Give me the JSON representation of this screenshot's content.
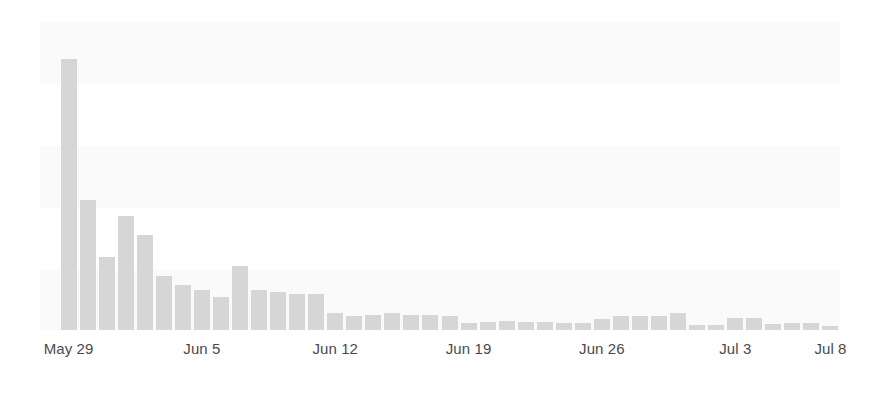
{
  "chart_data": {
    "type": "bar",
    "title": "",
    "subtitle": "",
    "xlabel": "",
    "ylabel": "",
    "grid": false,
    "legend": null,
    "legend_position": "none",
    "bar_color": "#d6d6d6",
    "background_color": "#ffffff",
    "band_color": "#fafafa",
    "tick_label_color": "#4a4a4a",
    "axis_range_x": [
      "May 28",
      "Jul 9"
    ],
    "ylim": [
      0,
      260
    ],
    "tick_labels": [
      "May 29",
      "Jun 5",
      "Jun 12",
      "Jun 19",
      "Jun 26",
      "Jul 3",
      "Jul 8"
    ],
    "tick_indices": [
      1,
      8,
      15,
      22,
      29,
      36,
      41
    ],
    "categories": [
      "May 28",
      "May 29",
      "May 30",
      "May 31",
      "Jun 1",
      "Jun 2",
      "Jun 3",
      "Jun 4",
      "Jun 5",
      "Jun 6",
      "Jun 7",
      "Jun 8",
      "Jun 9",
      "Jun 10",
      "Jun 11",
      "Jun 12",
      "Jun 13",
      "Jun 14",
      "Jun 15",
      "Jun 16",
      "Jun 17",
      "Jun 18",
      "Jun 19",
      "Jun 20",
      "Jun 21",
      "Jun 22",
      "Jun 23",
      "Jun 24",
      "Jun 25",
      "Jun 26",
      "Jun 27",
      "Jun 28",
      "Jun 29",
      "Jun 30",
      "Jul 1",
      "Jul 2",
      "Jul 3",
      "Jul 4",
      "Jul 5",
      "Jul 6",
      "Jul 7",
      "Jul 8"
    ],
    "values": [
      0,
      229,
      110,
      62,
      96,
      80,
      46,
      38,
      34,
      28,
      54,
      34,
      32,
      30,
      30,
      14,
      12,
      13,
      14,
      13,
      13,
      12,
      6,
      7,
      8,
      7,
      7,
      6,
      6,
      9,
      12,
      12,
      12,
      14,
      4,
      4,
      10,
      10,
      5,
      6,
      6,
      3
    ]
  }
}
